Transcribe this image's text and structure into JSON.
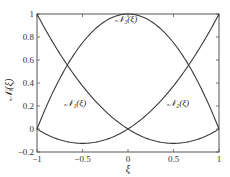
{
  "chart_data": {
    "type": "line",
    "title": "",
    "xlabel": "ξ",
    "ylabel": "𝒩ᵢ(ξ)",
    "xlim": [
      -1,
      1
    ],
    "ylim": [
      -0.2,
      1
    ],
    "xticks": [
      -1,
      -0.5,
      0,
      0.5,
      1
    ],
    "xtick_labels": [
      "−1",
      "−0.5",
      "0",
      "0.5",
      "1"
    ],
    "yticks": [
      -0.2,
      0,
      0.2,
      0.4,
      0.6,
      0.8,
      1
    ],
    "ytick_labels": [
      "−0.2",
      "0",
      "0.2",
      "0.4",
      "0.6",
      "0.8",
      "1"
    ],
    "grid": false,
    "legend": "inline labels",
    "x": [
      -1,
      -0.9,
      -0.8,
      -0.7,
      -0.6,
      -0.5,
      -0.4,
      -0.3,
      -0.2,
      -0.1,
      0,
      0.1,
      0.2,
      0.3,
      0.4,
      0.5,
      0.6,
      0.7,
      0.8,
      0.9,
      1
    ],
    "series": [
      {
        "name": "𝒩₁(ξ)",
        "formula": "ξ(ξ−1)/2",
        "values": [
          1,
          0.855,
          0.72,
          0.595,
          0.48,
          0.375,
          0.28,
          0.195,
          0.12,
          0.055,
          0,
          -0.045,
          -0.08,
          -0.105,
          -0.12,
          -0.125,
          -0.12,
          -0.105,
          -0.08,
          -0.045,
          0
        ],
        "label_pos": [
          -0.58,
          0.2
        ]
      },
      {
        "name": "𝒩₂(ξ)",
        "formula": "ξ(ξ+1)/2",
        "values": [
          0,
          -0.045,
          -0.08,
          -0.105,
          -0.12,
          -0.125,
          -0.12,
          -0.105,
          -0.08,
          -0.045,
          0,
          0.055,
          0.12,
          0.195,
          0.28,
          0.375,
          0.48,
          0.595,
          0.72,
          0.855,
          1
        ],
        "label_pos": [
          0.55,
          0.2
        ]
      },
      {
        "name": "𝒩₃(ξ)",
        "formula": "1−ξ²",
        "values": [
          0,
          0.19,
          0.36,
          0.51,
          0.64,
          0.75,
          0.84,
          0.91,
          0.96,
          0.99,
          1,
          0.99,
          0.96,
          0.91,
          0.84,
          0.75,
          0.64,
          0.51,
          0.36,
          0.19,
          0
        ],
        "label_pos": [
          -0.02,
          0.93
        ]
      }
    ]
  },
  "plot": {
    "left": 37,
    "right": 219,
    "top": 14,
    "bottom": 152,
    "line_color": "#3a3a3a",
    "axis_color": "#555555"
  }
}
